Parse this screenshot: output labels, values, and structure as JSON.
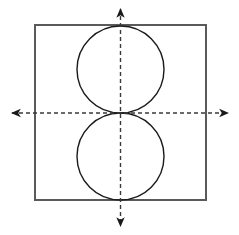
{
  "canvas": {
    "width": 239,
    "height": 235,
    "background": "#ffffff",
    "title": "Two congruent circles inscribed vertically in a square on coordinate axes"
  },
  "style": {
    "square_stroke": "#5a5a5a",
    "square_stroke_width": 2,
    "circle_stroke": "#1a1a1a",
    "circle_stroke_width": 1.4,
    "axis_stroke": "#3a3a3a",
    "axis_stroke_width": 1.4,
    "axis_dash": "4 3",
    "arrow_fill": "#1a1a1a"
  },
  "chart_data": {
    "type": "scatter",
    "xlabel": "",
    "ylabel": "",
    "grid": false,
    "legend": null,
    "origin": {
      "x": 120.5,
      "y": 113
    },
    "shapes": [
      {
        "name": "bounding-square",
        "kind": "rect",
        "x": 34,
        "y": 24,
        "width": 173,
        "height": 177,
        "stroke": "#5a5a5a",
        "fill": "none"
      },
      {
        "name": "upper-circle",
        "kind": "circle",
        "cx": 120.5,
        "cy": 69.5,
        "r": 43.5,
        "stroke": "#1a1a1a",
        "fill": "none"
      },
      {
        "name": "lower-circle",
        "kind": "circle",
        "cx": 120.5,
        "cy": 156.5,
        "r": 43.5,
        "stroke": "#1a1a1a",
        "fill": "none"
      }
    ],
    "axes": [
      {
        "name": "x-axis",
        "kind": "line",
        "x1": 8,
        "y1": 113,
        "x2": 232,
        "y2": 113,
        "dashed": true,
        "arrow_start": true,
        "arrow_end": true
      },
      {
        "name": "y-axis",
        "kind": "line",
        "x1": 120.5,
        "y1": 5,
        "x2": 120.5,
        "y2": 230,
        "dashed": true,
        "arrow_start": true,
        "arrow_end": true
      }
    ],
    "labels": []
  }
}
